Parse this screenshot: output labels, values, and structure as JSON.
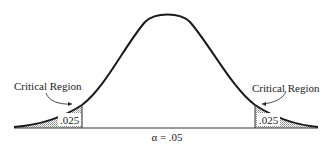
{
  "diagram": {
    "type": "normal-distribution-two-tailed-test",
    "left_region": {
      "label": "Critical Region",
      "area": ".025"
    },
    "right_region": {
      "label": "Critical Region",
      "area": ".025"
    },
    "alpha_label": "α = .05",
    "colors": {
      "curve": "#1a1a1a",
      "shade": "#bdbdbd",
      "text": "#222222"
    }
  }
}
